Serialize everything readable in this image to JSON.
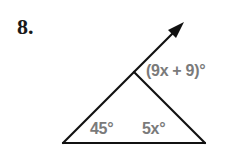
{
  "problem": {
    "number": "8.",
    "exterior_angle_label": "(9x + 9)°",
    "angle_left_label": "45°",
    "angle_right_label": "5x°"
  },
  "colors": {
    "line": "#111111",
    "label": "#7a7a7a"
  }
}
